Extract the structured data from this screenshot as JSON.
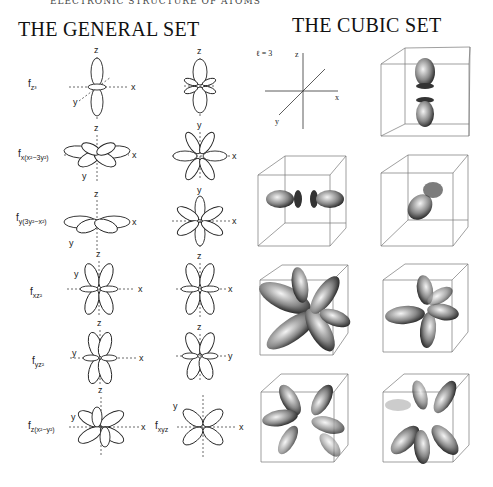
{
  "running_head": "ELECTRONIC STRUCTURE OF ATOMS",
  "general_set": {
    "title": "THE GENERAL SET",
    "rows": [
      {
        "label_main": "f",
        "label_sub": "z³",
        "axes_left": [
          "z",
          "y",
          "x"
        ],
        "axes_right": [
          "z"
        ]
      },
      {
        "label_main": "f",
        "label_sub": "x(x²−3y²)",
        "axes_left": [
          "z",
          "y",
          "x"
        ],
        "axes_right": [
          "y",
          "x"
        ]
      },
      {
        "label_main": "f",
        "label_sub": "y(3y²−x²)",
        "axes_left": [
          "z",
          "y",
          "x"
        ],
        "axes_right": [
          "y",
          "x"
        ]
      },
      {
        "label_main": "f",
        "label_sub": "xz²",
        "axes_left": [
          "z",
          "y",
          "x"
        ],
        "axes_right": [
          "z",
          "x"
        ]
      },
      {
        "label_main": "f",
        "label_sub": "yz²",
        "axes_left": [
          "z",
          "y",
          "x"
        ],
        "axes_right": [
          "z",
          "y"
        ]
      },
      {
        "label_main": "f",
        "label_sub": "z(x²−y²)",
        "axes_left": [
          "z",
          "y",
          "x"
        ],
        "axes_right_label_main": "f",
        "axes_right_label_sub": "xyz",
        "axes_right": [
          "y",
          "x"
        ]
      }
    ]
  },
  "cubic_set": {
    "title": "THE CUBIC SET",
    "axis_legend": {
      "label": "ℓ = 3",
      "axes": [
        "z",
        "x",
        "y"
      ]
    },
    "panels": 7
  }
}
